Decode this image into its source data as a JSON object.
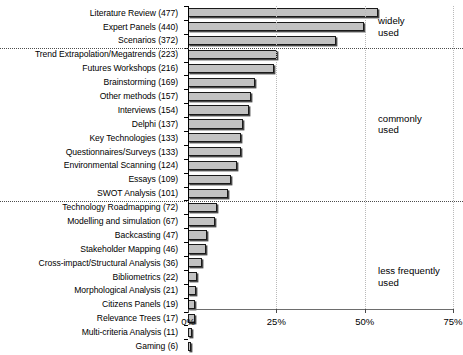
{
  "chart_data": {
    "type": "bar",
    "orientation": "horizontal",
    "title": "",
    "subtitle": "",
    "xlabel": "",
    "ylabel": "",
    "xlim": [
      0,
      75
    ],
    "xticks": [
      0,
      25,
      50,
      75
    ],
    "xtick_labels": [
      "0%",
      "25%",
      "50%",
      "75%"
    ],
    "grid": "vertical dotted gridlines at 25% and 50%",
    "legend": "none",
    "value_unit": "percent of respondents",
    "total_respondents": 886,
    "categories": [
      "Literature Review (477)",
      "Expert Panels (440)",
      "Scenarios (372)",
      "Trend Extrapolation/Megatrends (223)",
      "Futures Workshops (216)",
      "Brainstorming (169)",
      "Other methods (157)",
      "Interviews (154)",
      "Delphi (137)",
      "Key Technologies (133)",
      "Questionnaires/Surveys (133)",
      "Environmental Scanning (124)",
      "Essays (109)",
      "SWOT Analysis (101)",
      "Technology Roadmapping (72)",
      "Modelling and simulation (67)",
      "Backcasting (47)",
      "Stakeholder Mapping (46)",
      "Cross-impact/Structural Analysis (36)",
      "Bibliometrics (22)",
      "Morphological Analysis (21)",
      "Citizens Panels (19)",
      "Relevance Trees (17)",
      "Multi-criteria Analysis (11)",
      "Gaming (6)"
    ],
    "counts": [
      477,
      440,
      372,
      223,
      216,
      169,
      157,
      154,
      137,
      133,
      133,
      124,
      109,
      101,
      72,
      67,
      47,
      46,
      36,
      22,
      21,
      19,
      17,
      11,
      6
    ],
    "values": [
      53.8,
      49.7,
      42.0,
      25.2,
      24.4,
      19.1,
      17.7,
      17.4,
      15.5,
      15.0,
      15.0,
      14.0,
      12.3,
      11.4,
      8.1,
      7.6,
      5.3,
      5.2,
      4.1,
      2.5,
      2.4,
      2.1,
      1.9,
      1.2,
      0.7
    ],
    "annotations": [
      {
        "text": "widely\nused",
        "group_start": 0,
        "group_end": 2
      },
      {
        "text": "commonly\nused",
        "group_start": 3,
        "group_end": 13
      },
      {
        "text": "less frequently\nused",
        "group_start": 14,
        "group_end": 24
      }
    ],
    "separators_after_category": [
      2,
      13
    ],
    "bar_fill_color": "#c2c2c2",
    "bar_border_color": "#1a1a1a",
    "bar_shadow_color": "#4a4a4a"
  }
}
